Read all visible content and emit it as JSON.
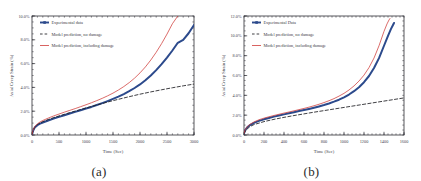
{
  "figure": {
    "panels": [
      {
        "id": "a",
        "caption": "(a)",
        "chart_data": {
          "type": "line",
          "title": "",
          "xlabel": "Time (Sec)",
          "ylabel": "Axial Creep Strain (%)",
          "xlim": [
            0,
            3000
          ],
          "ylim": [
            0,
            10
          ],
          "grid": false,
          "legend_position": "top-left",
          "xticks": [
            0,
            500,
            1000,
            1500,
            2000,
            2500,
            3000
          ],
          "xtick_labels": [
            "0",
            "500",
            "1000",
            "1500",
            "2000",
            "2500",
            "3000"
          ],
          "yticks": [
            0,
            2,
            4,
            6,
            8,
            10
          ],
          "ytick_labels": [
            "0.0%",
            "2.0%",
            "4.0%",
            "6.0%",
            "8.0%",
            "10.0%"
          ],
          "series": [
            {
              "name": "Experimental data",
              "color": "#2c4a8c",
              "style": "solid-thick-markers",
              "x": [
                0,
                20,
                50,
                100,
                150,
                200,
                300,
                400,
                500,
                600,
                700,
                800,
                900,
                1000,
                1100,
                1200,
                1300,
                1400,
                1500,
                1600,
                1700,
                1800,
                1900,
                2000,
                2100,
                2200,
                2300,
                2400,
                2500,
                2600,
                2700,
                2800,
                2900,
                3000
              ],
              "y": [
                0.05,
                0.35,
                0.62,
                0.82,
                0.95,
                1.05,
                1.22,
                1.38,
                1.52,
                1.66,
                1.8,
                1.94,
                2.08,
                2.22,
                2.36,
                2.52,
                2.68,
                2.85,
                3.03,
                3.22,
                3.44,
                3.68,
                3.95,
                4.25,
                4.6,
                5.0,
                5.45,
                5.95,
                6.5,
                7.1,
                7.75,
                8.0,
                8.55,
                9.25
              ]
            },
            {
              "name": "Model prediction, no damage",
              "color": "#1d1d22",
              "style": "dashed",
              "x": [
                0,
                20,
                50,
                100,
                150,
                200,
                300,
                400,
                500,
                600,
                700,
                800,
                900,
                1000,
                1200,
                1400,
                1600,
                1800,
                2000,
                2200,
                2400,
                2600,
                2800,
                3000
              ],
              "y": [
                0.05,
                0.38,
                0.66,
                0.88,
                1.02,
                1.12,
                1.3,
                1.46,
                1.6,
                1.74,
                1.88,
                2.01,
                2.14,
                2.27,
                2.52,
                2.77,
                3.0,
                3.22,
                3.43,
                3.62,
                3.8,
                3.97,
                4.13,
                4.28
              ]
            },
            {
              "name": "Model prediction, including damage",
              "color": "#cf3b38",
              "style": "solid-thin",
              "x": [
                0,
                20,
                50,
                100,
                150,
                200,
                300,
                400,
                500,
                600,
                700,
                800,
                900,
                1000,
                1100,
                1200,
                1300,
                1400,
                1500,
                1600,
                1700,
                1800,
                1900,
                2000,
                2100,
                2200,
                2300,
                2400,
                2500,
                2600,
                2700,
                2750
              ],
              "y": [
                0.05,
                0.4,
                0.7,
                0.94,
                1.1,
                1.22,
                1.42,
                1.6,
                1.76,
                1.92,
                2.07,
                2.22,
                2.38,
                2.54,
                2.71,
                2.89,
                3.08,
                3.29,
                3.52,
                3.78,
                4.07,
                4.4,
                4.78,
                5.22,
                5.72,
                6.3,
                6.95,
                7.68,
                8.48,
                9.35,
                10.0,
                10.3
              ]
            }
          ]
        }
      },
      {
        "id": "b",
        "caption": "(b)",
        "chart_data": {
          "type": "line",
          "title": "",
          "xlabel": "Time (Sec)",
          "ylabel": "Axial Creep Strain (%)",
          "xlim": [
            0,
            1600
          ],
          "ylim": [
            0,
            12
          ],
          "grid": false,
          "legend_position": "top-left",
          "xticks": [
            0,
            200,
            400,
            600,
            800,
            1000,
            1200,
            1400,
            1600
          ],
          "xtick_labels": [
            "0",
            "200",
            "400",
            "600",
            "800",
            "1000",
            "1200",
            "1400",
            "1600"
          ],
          "yticks": [
            0,
            2,
            4,
            6,
            8,
            10,
            12
          ],
          "ytick_labels": [
            "0.0%",
            "2.0%",
            "4.0%",
            "6.0%",
            "8.0%",
            "10.0%",
            "12.0%"
          ],
          "series": [
            {
              "name": "Experimental Data",
              "color": "#2c4a8c",
              "style": "solid-thick-markers",
              "x": [
                0,
                10,
                30,
                60,
                100,
                150,
                200,
                250,
                300,
                350,
                400,
                450,
                500,
                550,
                600,
                650,
                700,
                750,
                800,
                850,
                900,
                950,
                1000,
                1050,
                1100,
                1150,
                1200,
                1250,
                1300,
                1350,
                1400,
                1440,
                1470,
                1490,
                1500
              ],
              "y": [
                0.15,
                0.45,
                0.75,
                1.0,
                1.22,
                1.42,
                1.58,
                1.72,
                1.85,
                1.97,
                2.08,
                2.19,
                2.3,
                2.41,
                2.52,
                2.63,
                2.75,
                2.88,
                3.02,
                3.18,
                3.36,
                3.56,
                3.8,
                4.08,
                4.42,
                4.82,
                5.32,
                5.95,
                6.75,
                7.75,
                9.0,
                10.0,
                10.7,
                11.1,
                11.3
              ]
            },
            {
              "name": "Model prediction, no damage",
              "color": "#1d1d22",
              "style": "dashed",
              "x": [
                0,
                20,
                60,
                100,
                200,
                300,
                400,
                500,
                600,
                700,
                800,
                900,
                1000,
                1100,
                1200,
                1300,
                1400,
                1500,
                1600
              ],
              "y": [
                0.15,
                0.5,
                0.85,
                1.05,
                1.35,
                1.58,
                1.78,
                1.96,
                2.13,
                2.3,
                2.46,
                2.62,
                2.78,
                2.94,
                3.1,
                3.26,
                3.42,
                3.58,
                3.74
              ]
            },
            {
              "name": "Model prediction, including damage",
              "color": "#cf3b38",
              "style": "solid-thin",
              "x": [
                0,
                10,
                30,
                60,
                100,
                150,
                200,
                250,
                300,
                350,
                400,
                450,
                500,
                550,
                600,
                650,
                700,
                750,
                800,
                850,
                900,
                950,
                1000,
                1050,
                1100,
                1150,
                1200,
                1250,
                1300,
                1350,
                1400,
                1430,
                1450,
                1460
              ],
              "y": [
                0.15,
                0.5,
                0.82,
                1.08,
                1.32,
                1.54,
                1.7,
                1.84,
                1.97,
                2.09,
                2.21,
                2.32,
                2.44,
                2.56,
                2.68,
                2.81,
                2.95,
                3.1,
                3.27,
                3.46,
                3.67,
                3.92,
                4.2,
                4.54,
                4.95,
                5.44,
                6.04,
                6.8,
                7.76,
                9.0,
                10.45,
                11.2,
                11.6,
                11.75
              ]
            }
          ]
        }
      }
    ]
  }
}
